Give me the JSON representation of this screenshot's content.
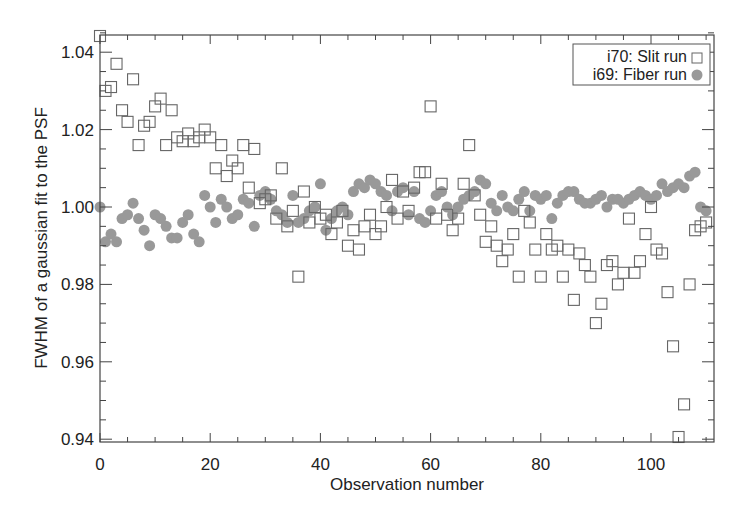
{
  "chart_data": {
    "type": "scatter",
    "title": "",
    "xlabel": "Observation number",
    "ylabel": "FWHM of a gaussian fit to the PSF",
    "xlim": [
      0,
      111
    ],
    "ylim": [
      0.94,
      1.045
    ],
    "xticks": [
      0,
      20,
      40,
      60,
      80,
      100
    ],
    "yticks": [
      0.94,
      0.96,
      0.98,
      1.0,
      1.02,
      1.04
    ],
    "xtick_labels": [
      "0",
      "20",
      "40",
      "60",
      "80",
      "100"
    ],
    "ytick_labels": [
      "0.94",
      "0.96",
      "0.98",
      "1.00",
      "1.02",
      "1.04"
    ],
    "grid": false,
    "legend_position": "upper right",
    "series": [
      {
        "name": "i70: Slit run",
        "marker": "open-square",
        "color": "#555555",
        "x": [
          0,
          1,
          2,
          3,
          4,
          5,
          6,
          7,
          8,
          9,
          10,
          11,
          12,
          13,
          14,
          15,
          16,
          17,
          18,
          19,
          20,
          21,
          22,
          23,
          24,
          25,
          26,
          27,
          28,
          29,
          30,
          31,
          32,
          33,
          34,
          35,
          36,
          37,
          38,
          39,
          40,
          41,
          42,
          43,
          44,
          45,
          46,
          47,
          48,
          49,
          50,
          51,
          52,
          53,
          54,
          55,
          56,
          57,
          58,
          59,
          60,
          61,
          62,
          63,
          64,
          65,
          66,
          67,
          68,
          69,
          70,
          71,
          72,
          73,
          74,
          75,
          76,
          77,
          78,
          79,
          80,
          81,
          82,
          83,
          84,
          85,
          86,
          87,
          88,
          89,
          90,
          91,
          92,
          93,
          94,
          95,
          96,
          97,
          98,
          99,
          100,
          101,
          102,
          103,
          104,
          105,
          106,
          107,
          108,
          109,
          110
        ],
        "y": [
          1.045,
          1.03,
          1.031,
          1.037,
          1.025,
          1.022,
          1.033,
          1.016,
          1.021,
          1.022,
          1.026,
          1.028,
          1.016,
          1.025,
          1.018,
          1.017,
          1.019,
          1.017,
          1.018,
          1.02,
          1.018,
          1.01,
          1.016,
          1.008,
          1.012,
          1.01,
          1.016,
          1.005,
          1.015,
          1.001,
          1.002,
          1.003,
          0.997,
          1.01,
          0.995,
          0.999,
          0.982,
          1.004,
          0.996,
          1.0,
          0.997,
          0.998,
          0.993,
          0.996,
          0.999,
          0.99,
          0.994,
          0.989,
          0.995,
          0.998,
          0.993,
          0.995,
          1.0,
          1.007,
          0.997,
          1.004,
          0.999,
          1.005,
          1.009,
          1.009,
          1.026,
          0.997,
          1.006,
          0.998,
          0.994,
          0.997,
          1.006,
          1.016,
          1.003,
          0.998,
          0.991,
          0.995,
          0.99,
          0.986,
          0.989,
          0.993,
          0.982,
          0.999,
          0.996,
          0.989,
          0.982,
          0.993,
          0.989,
          0.99,
          0.982,
          0.989,
          0.976,
          0.988,
          0.985,
          0.982,
          0.97,
          0.975,
          0.985,
          0.986,
          0.98,
          0.983,
          0.997,
          0.983,
          0.986,
          0.993,
          1.0,
          0.989,
          0.988,
          0.978,
          0.964,
          0.939,
          0.949,
          0.98,
          0.994,
          0.995,
          0.996
        ]
      },
      {
        "name": "i69: Fiber run",
        "marker": "filled-circle",
        "color": "#999999",
        "x": [
          0,
          1,
          2,
          3,
          4,
          5,
          6,
          7,
          8,
          9,
          10,
          11,
          12,
          13,
          14,
          15,
          16,
          17,
          18,
          19,
          20,
          21,
          22,
          23,
          24,
          25,
          26,
          27,
          28,
          29,
          30,
          31,
          32,
          33,
          34,
          35,
          36,
          37,
          38,
          39,
          40,
          41,
          42,
          43,
          44,
          45,
          46,
          47,
          48,
          49,
          50,
          51,
          52,
          53,
          54,
          55,
          56,
          57,
          58,
          59,
          60,
          61,
          62,
          63,
          64,
          65,
          66,
          67,
          68,
          69,
          70,
          71,
          72,
          73,
          74,
          75,
          76,
          77,
          78,
          79,
          80,
          81,
          82,
          83,
          84,
          85,
          86,
          87,
          88,
          89,
          90,
          91,
          92,
          93,
          94,
          95,
          96,
          97,
          98,
          99,
          100,
          101,
          102,
          103,
          104,
          105,
          106,
          107,
          108,
          109,
          110
        ],
        "y": [
          1.0,
          0.991,
          0.993,
          0.991,
          0.997,
          0.998,
          1.001,
          0.997,
          0.994,
          0.99,
          0.998,
          0.997,
          0.995,
          0.992,
          0.992,
          0.996,
          0.998,
          0.993,
          0.991,
          1.003,
          1.0,
          0.996,
          1.002,
          1.0,
          0.997,
          0.998,
          1.002,
          1.001,
          0.995,
          1.003,
          1.004,
          1.002,
          0.999,
          0.998,
          0.996,
          1.003,
          0.996,
          0.997,
          0.999,
          1.0,
          1.006,
          0.994,
          0.997,
          0.999,
          1.0,
          0.998,
          1.004,
          1.006,
          1.005,
          1.007,
          1.006,
          1.004,
          1.003,
          0.999,
          1.004,
          1.005,
          0.998,
          1.004,
          0.997,
          0.996,
          0.999,
          1.003,
          1.004,
          1.0,
          0.998,
          1.0,
          1.002,
          1.003,
          1.004,
          1.007,
          1.006,
          1.001,
          0.999,
          1.003,
          1.0,
          0.999,
          1.002,
          1.004,
          0.999,
          1.003,
          1.002,
          1.003,
          0.997,
          1.001,
          1.003,
          1.004,
          1.004,
          1.002,
          1.001,
          1.001,
          1.002,
          1.003,
          1.0,
          1.002,
          1.002,
          1.001,
          1.002,
          1.003,
          1.004,
          1.003,
          1.002,
          1.003,
          1.006,
          1.004,
          1.005,
          1.006,
          1.005,
          1.008,
          1.009,
          1.0,
          0.999
        ]
      }
    ]
  },
  "legend": {
    "items": [
      {
        "label": "i70: Slit run",
        "marker": "open-square"
      },
      {
        "label": "i69: Fiber run",
        "marker": "filled-circle"
      }
    ]
  }
}
